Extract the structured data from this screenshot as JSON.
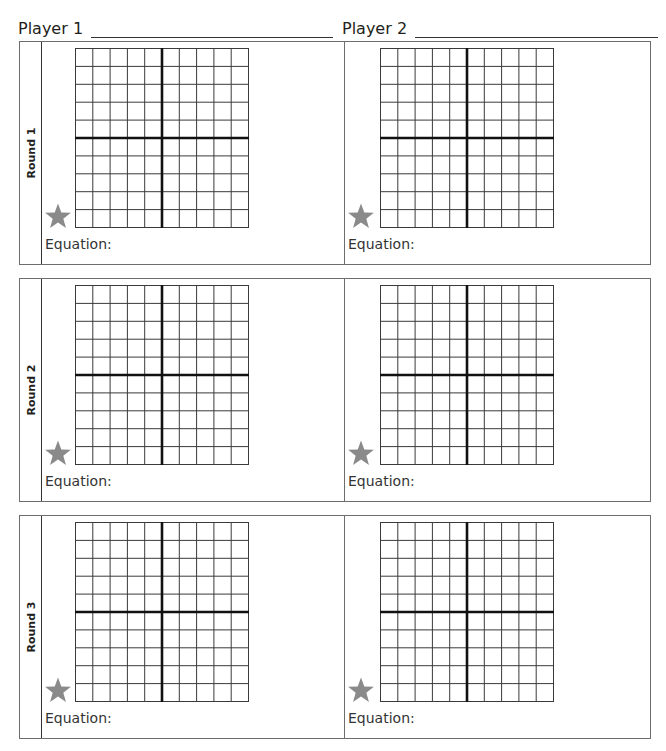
{
  "header": {
    "player1_label": "Player 1",
    "player2_label": "Player 2"
  },
  "grid": {
    "columns": 10,
    "rows": 10,
    "axis_column": 5,
    "axis_row": 5
  },
  "colors": {
    "grid_line": "#3a3a3a",
    "axis_line": "#111111",
    "star": "#8a8a8a",
    "border": "#6d6d6d"
  },
  "rounds": [
    {
      "label": "Round 1",
      "player1": {
        "equation_label": "Equation:"
      },
      "player2": {
        "equation_label": "Equation:"
      }
    },
    {
      "label": "Round 2",
      "player1": {
        "equation_label": "Equation:"
      },
      "player2": {
        "equation_label": "Equation:"
      }
    },
    {
      "label": "Round 3",
      "player1": {
        "equation_label": "Equation:"
      },
      "player2": {
        "equation_label": "Equation:"
      }
    }
  ],
  "icons": {
    "star": "star-icon"
  }
}
